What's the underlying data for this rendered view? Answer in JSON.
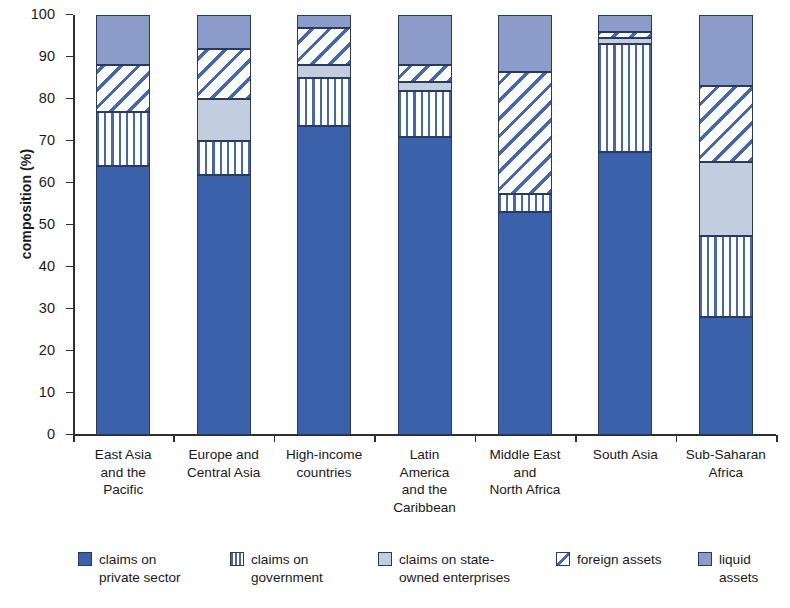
{
  "chart_data": {
    "type": "bar",
    "title": "",
    "xlabel": "",
    "ylabel": "composition (%)",
    "ylim": [
      0,
      100
    ],
    "yticks": [
      0,
      10,
      20,
      30,
      40,
      50,
      60,
      70,
      80,
      90,
      100
    ],
    "grid": false,
    "stacked": true,
    "stack_total": 100,
    "legend_position": "bottom",
    "categories": [
      "East Asia and the Pacific",
      "Europe and Central Asia",
      "High-income countries",
      "Latin America and the Caribbean",
      "Middle East and North Africa",
      "South Asia",
      "Sub-Saharan Africa"
    ],
    "category_label_lines": [
      [
        "East Asia",
        "and the",
        "Pacific"
      ],
      [
        "Europe and",
        "Central Asia"
      ],
      [
        "High-income",
        "countries"
      ],
      [
        "Latin",
        "America",
        "and the",
        "Caribbean"
      ],
      [
        "Middle East",
        "and",
        "North Africa"
      ],
      [
        "South Asia"
      ],
      [
        "Sub-Saharan",
        "Africa"
      ]
    ],
    "series": [
      {
        "name": "claims on private sector",
        "key": "private",
        "color": "#3a62ab",
        "pattern": "solid",
        "values": [
          64,
          62,
          73.5,
          71,
          53,
          67.5,
          28
        ]
      },
      {
        "name": "claims on government",
        "key": "government",
        "color": "#4567ad",
        "pattern": "vertical-stripes",
        "values": [
          13,
          8,
          11.5,
          11,
          4.5,
          25.5,
          19.5
        ]
      },
      {
        "name": "claims on state-owned enterprises",
        "key": "soe",
        "color": "#c3cde0",
        "pattern": "solid",
        "values": [
          0,
          10,
          3,
          2,
          0,
          1.5,
          17.5
        ]
      },
      {
        "name": "foreign assets",
        "key": "foreign",
        "color": "#4567ad",
        "pattern": "diagonal-stripes",
        "values": [
          11,
          12,
          9,
          4,
          29,
          1.5,
          18
        ]
      },
      {
        "name": "liquid assets",
        "key": "liquid",
        "color": "#8b9ccb",
        "pattern": "solid",
        "values": [
          12,
          8,
          3,
          12,
          13.5,
          4,
          17
        ]
      }
    ],
    "cumulative_tops": [
      [
        64,
        77,
        77,
        88,
        100
      ],
      [
        62,
        70,
        80,
        92,
        100
      ],
      [
        73.5,
        85,
        88,
        97,
        100
      ],
      [
        71,
        82,
        84,
        88,
        100
      ],
      [
        53,
        57.5,
        57.5,
        86.5,
        100
      ],
      [
        67.5,
        93,
        94.5,
        96,
        100
      ],
      [
        28,
        47.5,
        65,
        83,
        100
      ]
    ]
  },
  "legend": {
    "items": [
      {
        "label_lines": [
          "claims on",
          "private sector"
        ],
        "key": "private"
      },
      {
        "label_lines": [
          "claims on",
          "government"
        ],
        "key": "government"
      },
      {
        "label_lines": [
          "claims on state-",
          "owned enterprises"
        ],
        "key": "soe"
      },
      {
        "label_lines": [
          "foreign assets"
        ],
        "key": "foreign"
      },
      {
        "label_lines": [
          "liquid assets"
        ],
        "key": "liquid"
      }
    ]
  },
  "colors": {
    "private": "#3a62ab",
    "government": "#4567ad",
    "soe": "#c3cde0",
    "foreign": "#4567ad",
    "liquid": "#8b9ccb",
    "axis": "#2e2e2e",
    "segment_border": "#2a3a5e",
    "background": "#ffffff"
  }
}
